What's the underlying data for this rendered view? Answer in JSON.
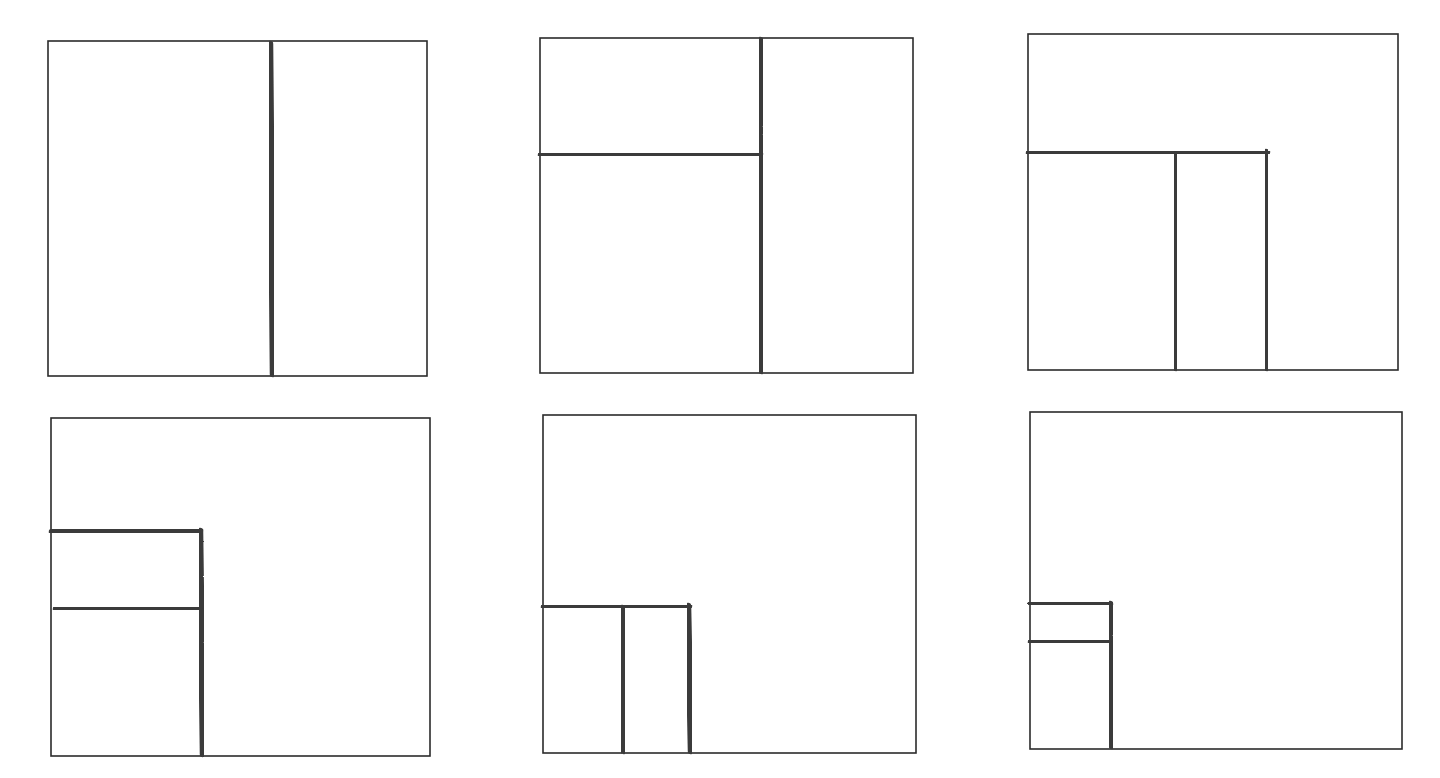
{
  "diagram": {
    "colors": {
      "background": "#ffffff",
      "frame": "#2b2b2b",
      "stroke": "#3a3a3a"
    },
    "stroke_width": 6.5,
    "frame_width": 1.6,
    "panels": [
      {
        "id": "panel-1",
        "frame": {
          "x1": 48,
          "y1": 41,
          "x2": 427,
          "y2": 376
        },
        "lines": [
          {
            "x1": 270,
            "y1": 44,
            "x2": 273,
            "y2": 374
          }
        ]
      },
      {
        "id": "panel-2",
        "frame": {
          "x1": 540,
          "y1": 38,
          "x2": 913,
          "y2": 373
        },
        "lines": [
          {
            "x1": 760,
            "y1": 40,
            "x2": 762,
            "y2": 371
          },
          {
            "x1": 541,
            "y1": 155,
            "x2": 760,
            "y2": 154
          }
        ]
      },
      {
        "id": "panel-3",
        "frame": {
          "x1": 1028,
          "y1": 34,
          "x2": 1398,
          "y2": 370
        },
        "lines": [
          {
            "x1": 1029,
            "y1": 153,
            "x2": 1267,
            "y2": 152
          },
          {
            "x1": 1175,
            "y1": 155,
            "x2": 1176,
            "y2": 368
          },
          {
            "x1": 1266,
            "y1": 152,
            "x2": 1267,
            "y2": 368
          }
        ]
      },
      {
        "id": "panel-4",
        "frame": {
          "x1": 51,
          "y1": 418,
          "x2": 430,
          "y2": 756
        },
        "lines": [
          {
            "x1": 52,
            "y1": 532,
            "x2": 200,
            "y2": 530
          },
          {
            "x1": 200,
            "y1": 531,
            "x2": 203,
            "y2": 754
          },
          {
            "x1": 56,
            "y1": 609,
            "x2": 199,
            "y2": 608
          }
        ]
      },
      {
        "id": "panel-5",
        "frame": {
          "x1": 543,
          "y1": 415,
          "x2": 916,
          "y2": 753
        },
        "lines": [
          {
            "x1": 544,
            "y1": 607,
            "x2": 689,
            "y2": 606
          },
          {
            "x1": 622,
            "y1": 608,
            "x2": 624,
            "y2": 751
          },
          {
            "x1": 688,
            "y1": 606,
            "x2": 691,
            "y2": 751
          }
        ]
      },
      {
        "id": "panel-6",
        "frame": {
          "x1": 1030,
          "y1": 412,
          "x2": 1402,
          "y2": 749
        },
        "lines": [
          {
            "x1": 1031,
            "y1": 603,
            "x2": 1110,
            "y2": 604
          },
          {
            "x1": 1110,
            "y1": 604,
            "x2": 1112,
            "y2": 746
          },
          {
            "x1": 1031,
            "y1": 642,
            "x2": 1108,
            "y2": 641
          }
        ]
      }
    ]
  }
}
